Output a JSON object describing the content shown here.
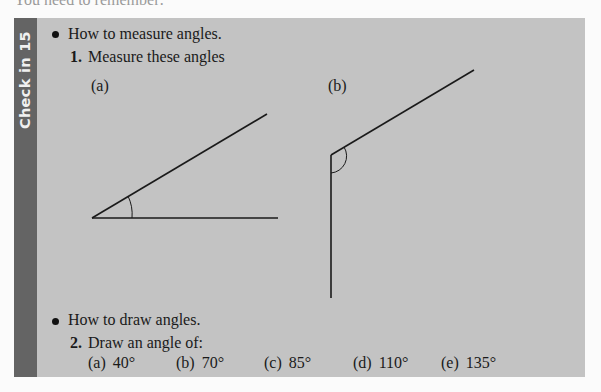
{
  "header": {
    "clipped_text": "You need to remember:"
  },
  "section": {
    "tab_label": "Check in 15",
    "colors": {
      "box_background": "#c3c3c3",
      "tab_background": "#646464",
      "tab_text": "#f0f0f0",
      "line": "#1a1a1a"
    },
    "topics": [
      {
        "bullet_text": "How to measure angles.",
        "question_number": "1.",
        "question_text": "Measure these angles",
        "figures": [
          {
            "label": "(a)",
            "description": "acute angle, vertex at lower left, horizontal arm to the right, second arm rising up-right",
            "arc": "small arc near vertex"
          },
          {
            "label": "(b)",
            "description": "obtuse angle, vertex at top left, vertical arm going down, second arm rising up-right",
            "arc": "small arc near vertex"
          }
        ]
      },
      {
        "bullet_text": "How to draw angles.",
        "question_number": "2.",
        "question_text": "Draw an angle of:",
        "options": [
          {
            "label": "(a)",
            "value": "40°"
          },
          {
            "label": "(b)",
            "value": "70°"
          },
          {
            "label": "(c)",
            "value": "85°"
          },
          {
            "label": "(d)",
            "value": "110°"
          },
          {
            "label": "(e)",
            "value": "135°"
          }
        ]
      }
    ]
  }
}
